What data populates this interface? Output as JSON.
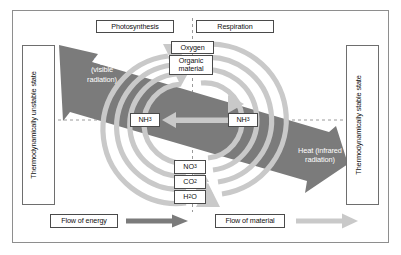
{
  "diagram": {
    "colors": {
      "energy_band": "#7b7b7b",
      "material_arrow": "#c9c9c9",
      "frame": "#8e8e8e",
      "box_border": "#4a4a4a",
      "text": "#111111",
      "band_text": "#ffffff",
      "dashed_line": "#9a9a9a"
    }
  },
  "process_headers": {
    "left": "Photosynthesis",
    "right": "Respiration"
  },
  "state_axes": {
    "left": {
      "label": "Thermodynamically unstable state",
      "arrow_direction": "up",
      "icon": "arrow-up-icon"
    },
    "right": {
      "label": "Thermodynamically stable state",
      "arrow_direction": "down",
      "icon": "arrow-down-icon"
    }
  },
  "energy_band": {
    "left_label_line1": "Light",
    "left_label_line2": "(visible",
    "left_label_line3": "radiation)",
    "right_label_line1": "Heat (infrared",
    "right_label_line2": "radiation)"
  },
  "compounds": {
    "top": [
      {
        "name": "oxygen",
        "label": "Oxygen"
      },
      {
        "name": "organic-material",
        "label_line1": "Organic",
        "label_line2": "material"
      }
    ],
    "middle": [
      {
        "name": "nh3-left",
        "formula": "NH",
        "sub": "3"
      },
      {
        "name": "nh3-right",
        "formula": "NH",
        "sub": "3"
      }
    ],
    "bottom": [
      {
        "name": "no3",
        "formula": "NO",
        "sub": "3"
      },
      {
        "name": "co2",
        "formula": "CO",
        "sub": "2"
      },
      {
        "name": "h2o",
        "formula": "H",
        "sub": "2",
        "formula_tail": "O"
      }
    ]
  },
  "legend": {
    "energy": {
      "label": "Flow of energy",
      "swatch": "energy-arrow-icon"
    },
    "material": {
      "label": "Flow of material",
      "swatch": "material-arrow-icon"
    }
  }
}
